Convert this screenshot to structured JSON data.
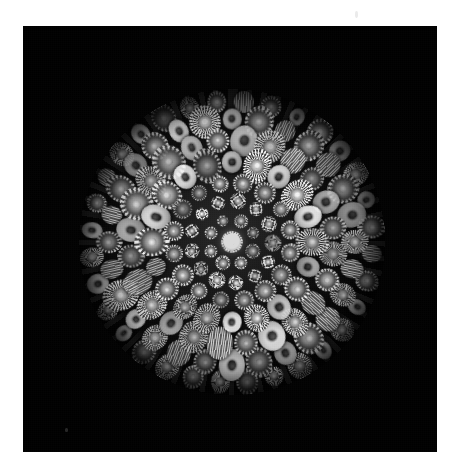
{
  "document": {
    "kind": "photograph",
    "medium": "black-and-white photographic print",
    "subject": "millefiori glass paperweight — concentric cane arrangement",
    "orientation": "square print on white page",
    "alt_text": "Monochrome photograph of a millefiori glass paperweight viewed from above, showing concentric rings of star, gear and rosette canes radiating from a single bright white central floret against a pure black background."
  },
  "page": {
    "background_color": "#ffffff",
    "width": 461,
    "height": 475
  },
  "photo": {
    "background_color": "#000000",
    "left": 23,
    "top": 26,
    "width": 414,
    "height": 426,
    "border_color": "#000000"
  },
  "artifacts": [
    {
      "name": "emulsion-speck-top-right",
      "x": 355,
      "y": 11,
      "w": 3,
      "h": 7,
      "tone": "light"
    },
    {
      "name": "emulsion-speck-bottom-left",
      "x": 65,
      "y": 428,
      "w": 3,
      "h": 4,
      "tone": "dark"
    }
  ],
  "dome": {
    "center_x": 232,
    "center_y": 242,
    "diameter": 306,
    "radius": 153,
    "highlight_color": "#787878",
    "rim_color": "#000000",
    "spoke_count": 64
  },
  "palette": {
    "paper_white": "#ffffff",
    "field_black": "#000000",
    "cane_highlight": "#f2f2f2",
    "cane_midtone": "#9a9a9a",
    "cane_shadow": "#3c3c3c",
    "pupil_dark": "#1e1e1e"
  },
  "chart_data": {
    "type": "scatter",
    "xlabel": "angle (degrees)",
    "ylabel": "radius (px from centre)",
    "grid": false,
    "legend": "none",
    "center": {
      "x": 232,
      "y": 242
    },
    "rings": [
      {
        "index": 0,
        "radius": 0,
        "count": 1,
        "cane_size": 17,
        "cane_type": "centre",
        "phase": 0
      },
      {
        "index": 1,
        "radius": 23,
        "count": 8,
        "cane_size": 11,
        "cane_type": "gear",
        "phase": 22
      },
      {
        "index": 2,
        "radius": 41,
        "count": 13,
        "cane_size": 13,
        "cane_type": "rosette",
        "phase": 8
      },
      {
        "index": 3,
        "radius": 59,
        "count": 16,
        "cane_size": 16,
        "cane_type": "gear",
        "phase": 11
      },
      {
        "index": 4,
        "radius": 80,
        "count": 20,
        "cane_size": 21,
        "cane_type": "mixed",
        "phase": 0
      },
      {
        "index": 5,
        "radius": 102,
        "count": 24,
        "cane_size": 23,
        "cane_type": "mixed",
        "phase": 7
      },
      {
        "index": 6,
        "radius": 123,
        "count": 28,
        "cane_size": 22,
        "cane_type": "mixed",
        "phase": 0
      },
      {
        "index": 7,
        "radius": 141,
        "count": 32,
        "cane_size": 18,
        "cane_type": "mixed",
        "phase": 5
      }
    ],
    "ring_radii": [
      0,
      23,
      41,
      59,
      80,
      102,
      123,
      141
    ],
    "ring_counts": [
      1,
      8,
      13,
      16,
      20,
      24,
      28,
      32
    ],
    "total_canes": 142,
    "cane_types": [
      "centre",
      "gear",
      "rosette",
      "blob",
      "ribbed"
    ],
    "ylim": [
      0,
      153
    ],
    "xlim": [
      0,
      360
    ]
  }
}
